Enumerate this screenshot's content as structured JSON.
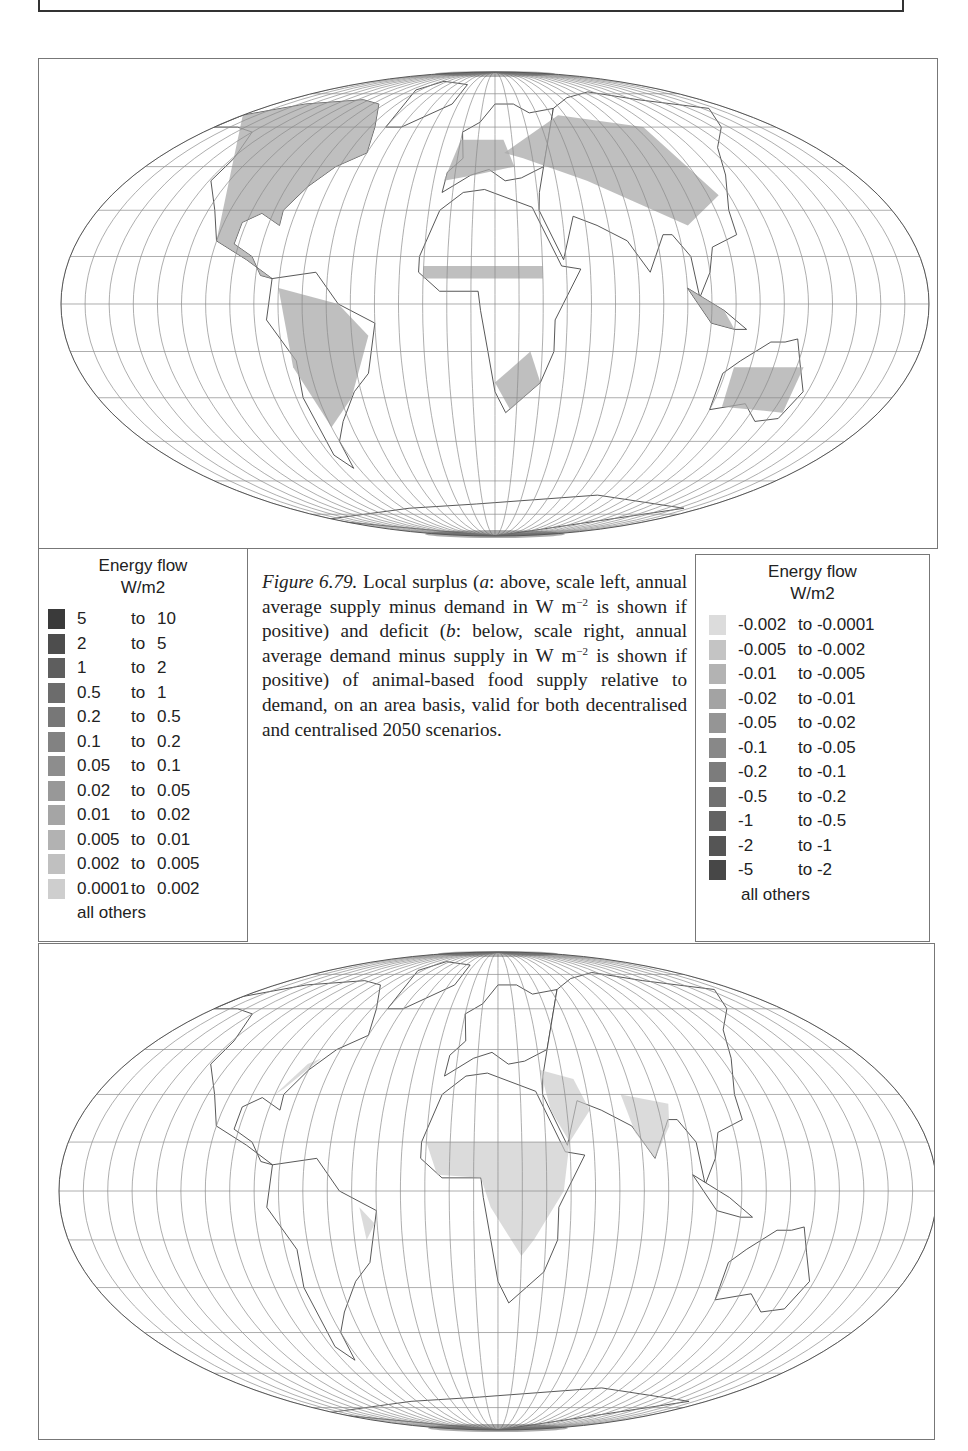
{
  "header": {
    "running_head": "SYSTEMS"
  },
  "figure": {
    "number_label": "Figure 6.79.",
    "caption_parts": [
      {
        "text": " Local surplus (",
        "italic": false
      },
      {
        "text": "a",
        "italic": true
      },
      {
        "text": ": above, scale left, annual average supply minus demand in W m",
        "italic": false
      },
      {
        "text": "−2",
        "sup": true
      },
      {
        "text": " is shown if positive) and deficit (",
        "italic": false
      },
      {
        "text": "b",
        "italic": true
      },
      {
        "text": ": below, scale right, annual average demand minus supply in W m",
        "italic": false
      },
      {
        "text": "−2",
        "sup": true
      },
      {
        "text": " is shown if positive) of animal-based food supply relative to demand, on an area basis, valid for both decentralised and centralised 2050 scenarios.",
        "italic": false
      }
    ]
  },
  "legend_left": {
    "title_line1": "Energy flow",
    "title_line2": "W/m2",
    "rows": [
      {
        "lo": "5",
        "to": "to",
        "hi": "10",
        "color": "#3a3a3a"
      },
      {
        "lo": "2",
        "to": "to",
        "hi": "5",
        "color": "#4d4d4d"
      },
      {
        "lo": "1",
        "to": "to",
        "hi": "2",
        "color": "#5e5e5e"
      },
      {
        "lo": "0.5",
        "to": "to",
        "hi": "1",
        "color": "#6c6c6c"
      },
      {
        "lo": "0.2",
        "to": "to",
        "hi": "0.5",
        "color": "#777777"
      },
      {
        "lo": "0.1",
        "to": "to",
        "hi": "0.2",
        "color": "#828282"
      },
      {
        "lo": "0.05",
        "to": "to",
        "hi": "0.1",
        "color": "#8d8d8d"
      },
      {
        "lo": "0.02",
        "to": "to",
        "hi": "0.05",
        "color": "#989898"
      },
      {
        "lo": "0.01",
        "to": "to",
        "hi": "0.02",
        "color": "#a5a5a5"
      },
      {
        "lo": "0.005",
        "to": "to",
        "hi": "0.01",
        "color": "#b2b2b2"
      },
      {
        "lo": "0.002",
        "to": "to",
        "hi": "0.005",
        "color": "#c0c0c0"
      },
      {
        "lo": "0.0001",
        "to": "to",
        "hi": "0.002",
        "color": "#cecece"
      }
    ],
    "others_label": "all others"
  },
  "legend_right": {
    "title_line1": "Energy flow",
    "title_line2": "W/m2",
    "rows": [
      {
        "lo": "-0.002",
        "to": "to",
        "hi": "-0.0001",
        "color": "#dcdcdc"
      },
      {
        "lo": "-0.005",
        "to": "to",
        "hi": "-0.002",
        "color": "#c4c4c4"
      },
      {
        "lo": "-0.01",
        "to": "to",
        "hi": "-0.005",
        "color": "#b3b3b3"
      },
      {
        "lo": "-0.02",
        "to": "to",
        "hi": "-0.01",
        "color": "#a3a3a3"
      },
      {
        "lo": "-0.05",
        "to": "to",
        "hi": "-0.02",
        "color": "#959595"
      },
      {
        "lo": "-0.1",
        "to": "to",
        "hi": "-0.05",
        "color": "#888888"
      },
      {
        "lo": "-0.2",
        "to": "to",
        "hi": "-0.1",
        "color": "#7c7c7c"
      },
      {
        "lo": "-0.5",
        "to": "to",
        "hi": "-0.2",
        "color": "#707070"
      },
      {
        "lo": "-1",
        "to": "to",
        "hi": "-0.5",
        "color": "#636363"
      },
      {
        "lo": "-2",
        "to": "to",
        "hi": "-1",
        "color": "#555555"
      },
      {
        "lo": "-5",
        "to": "to",
        "hi": "-2",
        "color": "#474747"
      }
    ],
    "others_label": "all others"
  },
  "maps": {
    "a": {
      "label": "Local surplus (supply minus demand)",
      "land_fill": "#a9a9a9"
    },
    "b": {
      "label": "Deficit (demand minus supply)",
      "land_fill": "#c8c8c8"
    },
    "grid_color": "#8a8a8a",
    "outline_color": "#444444"
  }
}
